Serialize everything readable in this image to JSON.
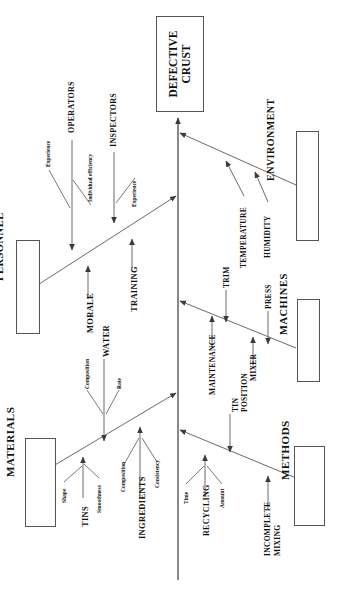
{
  "diagram": {
    "type": "fishbone-ishikawa",
    "orientation": "rotated-90-counterclockwise",
    "effect": {
      "line1": "DEFECTIVE",
      "line2": "CRUST"
    },
    "categories": [
      {
        "id": "environment",
        "label": "ENVIRONMENT",
        "causes": [
          {
            "label": "TEMPERATURE",
            "subcauses": []
          },
          {
            "label": "HUMIDITY",
            "subcauses": []
          }
        ]
      },
      {
        "id": "personnel",
        "label": "PERSONNEL",
        "causes": [
          {
            "label": "OPERATORS",
            "subcauses": [
              "Experience",
              "Individual efficiency"
            ]
          },
          {
            "label": "INSPECTORS",
            "subcauses": [
              "Experience"
            ]
          },
          {
            "label": "MORALE",
            "subcauses": []
          },
          {
            "label": "TRAINING",
            "subcauses": []
          }
        ]
      },
      {
        "id": "machines",
        "label": "MACHINES",
        "causes": [
          {
            "label": "MAINTENANCE",
            "subcauses": []
          },
          {
            "label": "TRIM",
            "subcauses": []
          },
          {
            "label": "MIXER",
            "subcauses": []
          },
          {
            "label": "PRESS",
            "subcauses": []
          }
        ]
      },
      {
        "id": "materials",
        "label": "MATERIALS",
        "causes": [
          {
            "label": "TINS",
            "subcauses": [
              "Shape",
              "Smoothness"
            ]
          },
          {
            "label": "WATER",
            "subcauses": [
              "Composition",
              "Rate"
            ]
          },
          {
            "label": "INGREDIENTS",
            "subcauses": [
              "Composition",
              "Consistency"
            ]
          }
        ]
      },
      {
        "id": "methods",
        "label": "METHODS",
        "causes": [
          {
            "label": "TIN POSITION",
            "subcauses": []
          },
          {
            "label": "RECYCLING",
            "subcauses": [
              "Time",
              "Amount"
            ]
          },
          {
            "label": "INCOMPLETE MIXING",
            "subcauses": []
          }
        ]
      }
    ],
    "colors": {
      "line": "#555555",
      "box_border": "#555555",
      "text": "#111111",
      "background": "#ffffff"
    }
  },
  "labels": {
    "effect_l1": "DEFECTIVE",
    "effect_l2": "CRUST",
    "cat_environment": "ENVIRONMENT",
    "cat_personnel": "PERSONNEL",
    "cat_machines": "MACHINES",
    "cat_materials": "MATERIALS",
    "cat_methods": "METHODS",
    "temperature": "TEMPERATURE",
    "humidity": "HUMIDITY",
    "operators": "OPERATORS",
    "inspectors": "INSPECTORS",
    "morale": "MORALE",
    "training": "TRAINING",
    "op_experience": "Experience",
    "op_individual_efficiency": "Individual efficiency",
    "insp_experience": "Experience",
    "maintenance": "MAINTENANCE",
    "trim": "TRIM",
    "mixer": "MIXER",
    "press": "PRESS",
    "tins": "TINS",
    "water": "WATER",
    "ingredients": "INGREDIENTS",
    "tins_shape": "Shape",
    "tins_smoothness": "Smoothness",
    "water_composition": "Composition",
    "water_rate": "Rate",
    "ing_composition": "Composition",
    "ing_consistency": "Consistency",
    "tin_position_l1": "TIN",
    "tin_position_l2": "POSITION",
    "recycling": "RECYCLING",
    "rec_time": "Time",
    "rec_amount": "Amount",
    "incomplete_l1": "INCOMPLETE",
    "incomplete_l2": "MIXING"
  }
}
